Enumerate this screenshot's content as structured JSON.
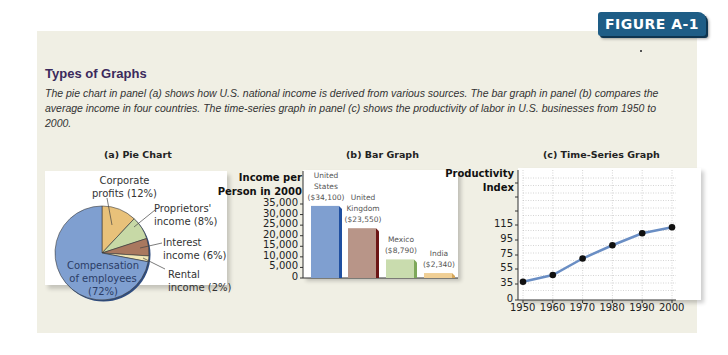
{
  "figure_label": "FIGURE A-1",
  "title": "Types of Graphs",
  "description": "The pie chart in panel (a) shows how U.S. national income is derived from various sources. The bar graph in panel (b) compares the average income in four countries. The time-series graph in panel (c) shows the productivity of labor in U.S. businesses from 1950 to 2000.",
  "colors": {
    "badge": "#1e5d86",
    "panel": "#f0efe4",
    "title": "#3b2a5c"
  },
  "chart_data": [
    {
      "type": "pie",
      "title": "(a) Pie Chart",
      "slices": [
        {
          "label": "Compensation of employees",
          "label_lines": [
            "Compensation",
            "of employees",
            "(72%)"
          ],
          "value": 72,
          "color": "#7f9fd0"
        },
        {
          "label": "Corporate profits",
          "label_lines": [
            "Corporate",
            "profits (12%)"
          ],
          "value": 12,
          "color": "#e8c17a"
        },
        {
          "label": "Proprietors' income",
          "label_lines": [
            "Proprietors'",
            "income (8%)"
          ],
          "value": 8,
          "color": "#c7d9a6"
        },
        {
          "label": "Interest income",
          "label_lines": [
            "Interest",
            "income (6%)"
          ],
          "value": 6,
          "color": "#a9785f"
        },
        {
          "label": "Rental income",
          "label_lines": [
            "Rental",
            "income (2%)"
          ],
          "value": 2,
          "color": "#f1e7b5"
        }
      ]
    },
    {
      "type": "bar",
      "title": "(b) Bar Graph",
      "ylabel": "Income per Person in 2000",
      "ylabel_lines": [
        "Income per",
        "Person in 2000"
      ],
      "categories": [
        "United States",
        "United Kingdom",
        "Mexico",
        "India"
      ],
      "values": [
        34100,
        23550,
        8790,
        2340
      ],
      "bar_labels": [
        [
          "United",
          "States",
          "($34,100)"
        ],
        [
          "United",
          "Kingdom",
          "($23,550)"
        ],
        [
          "Mexico",
          "($8,790)"
        ],
        [
          "India",
          "($2,340)"
        ]
      ],
      "colors": [
        "#7f9fd0",
        "#b89588",
        "#c9dcae",
        "#f0cf95"
      ],
      "yticks": [
        "35,000",
        "30,000",
        "25,000",
        "20,000",
        "15,000",
        "10,000",
        "5,000",
        "0"
      ],
      "ylim": [
        0,
        35000
      ]
    },
    {
      "type": "line",
      "title": "(c) Time-Series Graph",
      "ylabel": "Productivity Index",
      "ylabel_lines": [
        "Productivity",
        "Index"
      ],
      "x": [
        1950,
        1960,
        1970,
        1980,
        1990,
        2000
      ],
      "xticks": [
        "1950",
        "1960",
        "1970",
        "1980",
        "1990",
        "2000"
      ],
      "values": [
        38,
        47,
        70,
        88,
        104,
        112
      ],
      "yticks": [
        "115",
        "95",
        "75",
        "55",
        "35",
        "0"
      ],
      "grid": true,
      "line_color": "#6a8ec4"
    }
  ]
}
